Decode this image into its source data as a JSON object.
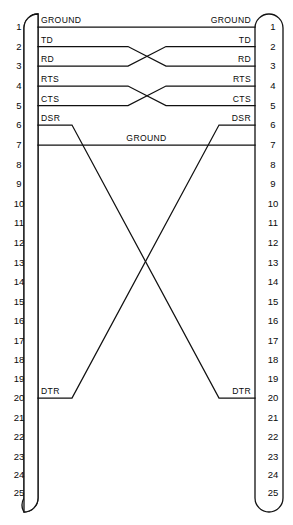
{
  "diagram": {
    "type": "wiring-diagram",
    "background_color": "#ffffff",
    "line_color": "#111111",
    "connectors": [
      {
        "id": "left-connector",
        "name": "DB-25 connector left",
        "side": "left",
        "pin_count": 25,
        "pins": [
          "1",
          "2",
          "3",
          "4",
          "5",
          "6",
          "7",
          "8",
          "9",
          "10",
          "11",
          "12",
          "13",
          "14",
          "15",
          "16",
          "17",
          "18",
          "19",
          "20",
          "21",
          "22",
          "23",
          "24",
          "25"
        ]
      },
      {
        "id": "right-connector",
        "name": "DB-25 connector right",
        "side": "right",
        "pin_count": 25,
        "pins": [
          "1",
          "2",
          "3",
          "4",
          "5",
          "6",
          "7",
          "8",
          "9",
          "10",
          "11",
          "12",
          "13",
          "14",
          "15",
          "16",
          "17",
          "18",
          "19",
          "20",
          "21",
          "22",
          "23",
          "24",
          "25"
        ]
      }
    ],
    "signals": [
      {
        "id": "ground1",
        "left_label": "GROUND",
        "right_label": "GROUND",
        "left_pin": "1",
        "right_pin": "1",
        "crossed": false
      },
      {
        "id": "td",
        "left_label": "TD",
        "right_label": "TD",
        "left_pin": "2",
        "right_pin": "3",
        "crossed": true
      },
      {
        "id": "rd",
        "left_label": "RD",
        "right_label": "RD",
        "left_pin": "3",
        "right_pin": "2",
        "crossed": true
      },
      {
        "id": "rts",
        "left_label": "RTS",
        "right_label": "RTS",
        "left_pin": "4",
        "right_pin": "5",
        "crossed": true
      },
      {
        "id": "cts",
        "left_label": "CTS",
        "right_label": "CTS",
        "left_pin": "5",
        "right_pin": "4",
        "crossed": true
      },
      {
        "id": "dsr",
        "left_label": "DSR",
        "right_label": "DSR",
        "left_pin": "6",
        "right_pin": "20",
        "crossed": true
      },
      {
        "id": "ground7",
        "left_label": "GROUND",
        "right_label": "GROUND",
        "center_label": "GROUND",
        "left_pin": "7",
        "right_pin": "7",
        "crossed": false
      },
      {
        "id": "dtr",
        "left_label": "DTR",
        "right_label": "DTR",
        "left_pin": "20",
        "right_pin": "6",
        "crossed": true
      }
    ],
    "center_labels": [
      {
        "id": "ground-center",
        "text": "GROUND"
      }
    ]
  }
}
